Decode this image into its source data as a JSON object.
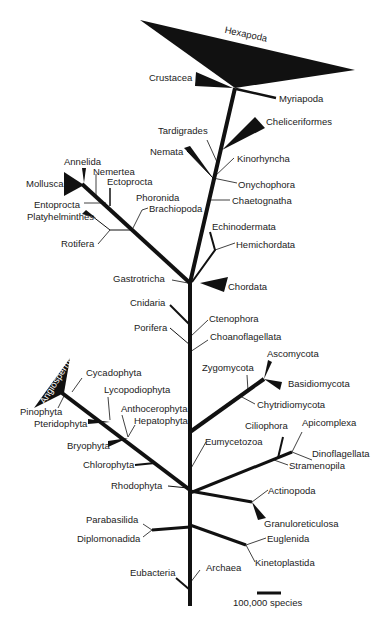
{
  "diagram": {
    "type": "phylogenetic-tree",
    "scale_bar": "100,000 species",
    "colors": {
      "branch": "#111111",
      "text": "#222222",
      "background": "#ffffff"
    },
    "labels": {
      "hexapoda": "Hexapoda",
      "crustacea": "Crustacea",
      "myriapoda": "Myriapoda",
      "chelicериformes": "Cheliceriformes",
      "tardigrades": "Tardigrades",
      "nemata": "Nemata",
      "kinorhyncha": "Kinorhyncha",
      "onychophora": "Onychophora",
      "chaetognatha": "Chaetognatha",
      "annelida": "Annelida",
      "nemertea": "Nemertea",
      "mollusca": "Mollusca",
      "ectoprocta": "Ectoprocta",
      "entoprocta": "Entoprocta",
      "phoronida": "Phoronida",
      "brachiopoda": "Brachiopoda",
      "platyhelminthes": "Platyhelminthes",
      "rotifera": "Rotifera",
      "echinodermata": "Echinodermata",
      "hemichordata": "Hemichordata",
      "gastrotricha": "Gastrotricha",
      "chordata": "Chordata",
      "cnidaria": "Cnidaria",
      "ctenophora": "Ctenophora",
      "porifera": "Porifera",
      "choanoflagellata": "Choanoflagellata",
      "angiosperms": "Angiosperms",
      "cycadophyta": "Cycadophyta",
      "lycopodiophyta": "Lycopodiophyta",
      "pinophyta": "Pinophyta",
      "pteridophyta": "Pteridophyta",
      "anthocerophyta": "Anthocerophyta",
      "hepatophyta": "Hepatophyta",
      "bryophyta": "Bryophyta",
      "chlorophyta": "Chlorophyta",
      "rhodophyta": "Rhodophyta",
      "zygomycota": "Zygomycota",
      "ascomycota": "Ascomycota",
      "basidiomycota": "Basidiomycota",
      "chytridiomycota": "Chytridiomycota",
      "eumycetozoa": "Eumycetozoa",
      "ciliophora": "Ciliophora",
      "apicomplexa": "Apicomplexa",
      "dinoflagellata": "Dinoflagellata",
      "stramenopila": "Stramenopila",
      "actinopoda": "Actinopoda",
      "granuloreticulosa": "Granuloreticulosa",
      "parabasilida": "Parabasilida",
      "diplomonadida": "Diplomonadida",
      "euglenida": "Euglenida",
      "kinetoplastida": "Kinetoplastida",
      "eubacteria": "Eubacteria",
      "archaea": "Archaea"
    }
  }
}
